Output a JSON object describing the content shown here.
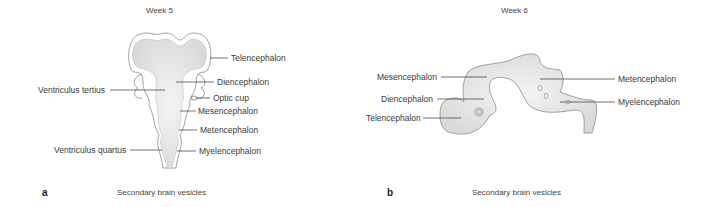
{
  "panels": [
    {
      "id": "a",
      "letter": "a",
      "title": "Week 5",
      "caption": "Secondary brain vesicles",
      "labels": {
        "telencephalon": "Telencephalon",
        "diencephalon": "Diencephalon",
        "ventriculus_tertius": "Ventriculus tertius",
        "optic_cup": "Optic cup",
        "mesencephalon": "Mesencephalon",
        "metencephalon": "Metencephalon",
        "ventriculus_quartus": "Ventriculus quartus",
        "myelencephalon": "Myelencephalon"
      }
    },
    {
      "id": "b",
      "letter": "b",
      "title": "Week 6",
      "caption": "Secondary brain vesicles",
      "labels": {
        "mesencephalon": "Mesencephalon",
        "diencephalon": "Diencephalon",
        "telencephalon": "Telencephalon",
        "metencephalon": "Metencephalon",
        "myelencephalon": "Myelencephalon"
      }
    }
  ],
  "colors": {
    "fill": "#e6e6e6",
    "outline": "#8a8a8a",
    "leader": "#333333"
  }
}
